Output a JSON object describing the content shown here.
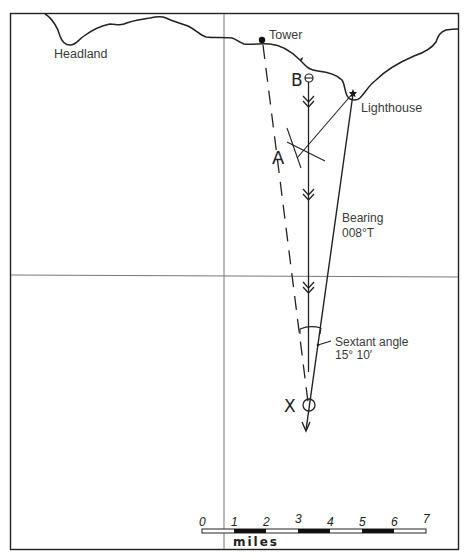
{
  "diagram": {
    "labels": {
      "headland": "Headland",
      "tower": "Tower",
      "lighthouse": "Lighthouse",
      "point_b": "B",
      "point_a": "A",
      "point_x": "X",
      "bearing_line1": "Bearing",
      "bearing_line2": "008°T",
      "sextant_line1": "Sextant angle",
      "sextant_line2": "15° 10′"
    },
    "scale_bar": {
      "ticks": [
        "0",
        "1",
        "2",
        "3",
        "4",
        "5",
        "6",
        "7"
      ],
      "unit": "miles"
    },
    "colors": {
      "ink": "#222222",
      "text": "#3a3a3a",
      "grid": "#777777",
      "background": "#ffffff"
    }
  }
}
